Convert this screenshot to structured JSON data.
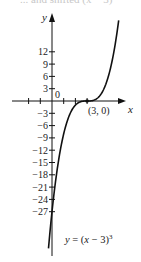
{
  "header": {
    "cut_text": "... and shifted (x − 3)"
  },
  "chart_data": {
    "type": "line",
    "title": "",
    "xlabel": "x",
    "ylabel": "y",
    "equation_label": "y = (x − 3)³",
    "point_label": "(3, 0)",
    "origin_label": "0",
    "x_ticks": [
      -2,
      -1,
      1,
      2,
      3
    ],
    "y_tick_labels": [
      "12",
      "9",
      "6",
      "3",
      "−3",
      "−6",
      "−9",
      "−12",
      "−15",
      "−18",
      "−21",
      "−24",
      "−27"
    ],
    "y_tick_values": [
      12,
      9,
      6,
      3,
      -3,
      -6,
      -9,
      -12,
      -15,
      -18,
      -21,
      -24,
      -27
    ],
    "xlim": [
      -3.5,
      7.5
    ],
    "ylim": [
      -37,
      21
    ],
    "grid": false,
    "series": [
      {
        "name": "y = (x − 3)^3",
        "x": [
          -0.3,
          0,
          1,
          2,
          3,
          4,
          5,
          5.7
        ],
        "y": [
          -35.9,
          -27,
          -8,
          -1,
          0,
          1,
          8,
          19.7
        ]
      }
    ],
    "key_point": {
      "x": 3,
      "y": 0
    },
    "colors": {
      "curve": "#111111",
      "axis": "#111111"
    }
  }
}
